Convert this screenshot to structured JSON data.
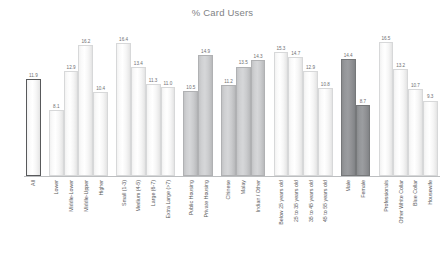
{
  "chart": {
    "title": "% Card Users"
  },
  "chart_data": {
    "type": "bar",
    "title": "% Card Users",
    "xlabel": "",
    "ylabel": "",
    "ylim": [
      0,
      18
    ],
    "grid": false,
    "legend": false,
    "value_labels": true,
    "orientation": "vertical",
    "categories": [
      "All",
      "Lower",
      "Middle-Lower",
      "Middle-Upper",
      "Higher",
      "Small (1-3)",
      "Medium (4-5)",
      "Large (6-7)",
      "Extra Large (>7)",
      "Public Housing",
      "Private Housing",
      "Chinese",
      "Malay",
      "Indian / Other",
      "Below 25 years old",
      "25 to 35 years old",
      "35 to 45 years old",
      "45 to 55 years old",
      "Male",
      "Female",
      "Professionals",
      "Other White Collar",
      "Blue Collar",
      "Housewife"
    ],
    "values": [
      11.9,
      8.1,
      12.9,
      16.2,
      10.4,
      16.4,
      13.4,
      11.3,
      11.0,
      10.5,
      14.9,
      11.2,
      13.5,
      14.3,
      15.3,
      14.7,
      12.9,
      10.8,
      14.4,
      8.7,
      16.5,
      13.2,
      10.7,
      9.3
    ],
    "bar_styles": [
      "outlined",
      "light",
      "light",
      "light",
      "light",
      "light",
      "light",
      "light",
      "light",
      "medium",
      "medium",
      "medium",
      "medium",
      "medium",
      "light",
      "light",
      "light",
      "light",
      "dark",
      "dark",
      "light",
      "light",
      "light",
      "light"
    ],
    "group_breaks": [
      1,
      5,
      9,
      11,
      14,
      18,
      20
    ],
    "colors": {
      "light": "#f4f4f4",
      "medium": "#cccdcf",
      "dark": "#939598",
      "outline": "#58595b",
      "text": "#58595b",
      "title": "#808285",
      "axis": "#bcbec0"
    }
  }
}
